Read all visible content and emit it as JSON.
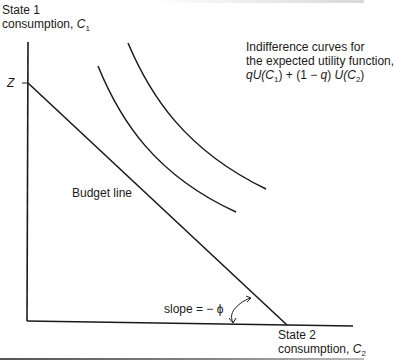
{
  "diagram": {
    "type": "expected-utility-indifference-curves",
    "y_axis": {
      "line1": "State 1",
      "line2_prefix": "consumption, ",
      "var": "C",
      "sub": "1"
    },
    "x_axis": {
      "line1": "State 2",
      "line2_prefix": "consumption, ",
      "var": "C",
      "sub": "2"
    },
    "intercept_label": "Z",
    "indifference_label": {
      "line1": "Indifference curves for",
      "line2": "the expected utility function,",
      "formula": {
        "q1": "q",
        "u1": "U(",
        "c1": "C",
        "s1": "1",
        "mid": ") + (1 − ",
        "q2": "q",
        "mid2": ") ",
        "u2": "U(",
        "c2": "C",
        "s2": "2",
        "end": ")"
      }
    },
    "budget_label": "Budget line",
    "slope_label": "slope = − ϕ",
    "colors": {
      "line": "#1a1a1a",
      "background": "#ffffff"
    },
    "geometry": {
      "origin": [
        27,
        321
      ],
      "y_axis_top": [
        28,
        42
      ],
      "x_axis_end": [
        353,
        326
      ],
      "budget_start": [
        28,
        83
      ],
      "budget_end": [
        287,
        325
      ],
      "curves": [
        {
          "name": "outer",
          "start": [
            128,
            43
          ],
          "end": [
            266,
            189
          ]
        },
        {
          "name": "inner",
          "start": [
            98,
            66
          ],
          "end": [
            236,
            212
          ]
        }
      ]
    }
  }
}
